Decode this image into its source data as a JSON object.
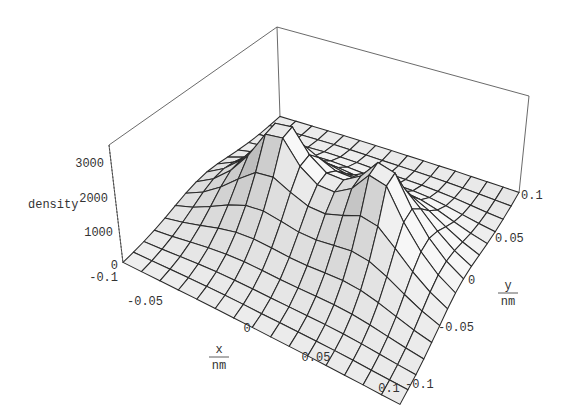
{
  "chart_data": {
    "type": "surface3d",
    "title": "",
    "zlabel": "density",
    "xlabel": {
      "numerator": "x",
      "denominator": "nm"
    },
    "ylabel": {
      "numerator": "y",
      "denominator": "nm"
    },
    "x_range": [
      -0.1,
      0.1
    ],
    "y_range": [
      -0.1,
      0.1
    ],
    "z_range": [
      0,
      3000
    ],
    "x_ticks": [
      "-0.1",
      "-0.05",
      "0",
      "0.05",
      "0.1"
    ],
    "y_ticks": [
      "-0.1",
      "-0.05",
      "0",
      "0.05",
      "0.1"
    ],
    "z_ticks": [
      "0",
      "1000",
      "2000",
      "3000"
    ],
    "grid_lines": 15,
    "peaks": [
      {
        "x": -0.04,
        "y": 0.0,
        "z": 3000
      },
      {
        "x": 0.04,
        "y": 0.0,
        "z": 3000
      }
    ],
    "note": "Two-center electron density distribution with cusps at the nuclear positions, mesh surface with bounding box"
  },
  "labels": {
    "z_axis": "density",
    "z_ticks": [
      "3000",
      "2000",
      "1000",
      "0"
    ],
    "x_ticks": [
      "-0.1",
      "-0.05",
      "0",
      "0.05",
      "0.1"
    ],
    "y_ticks": [
      "-0.1",
      "-0.05",
      "0",
      "0.05",
      "0.1"
    ],
    "x_num": "x",
    "x_den": "nm",
    "y_num": "y",
    "y_den": "nm"
  }
}
